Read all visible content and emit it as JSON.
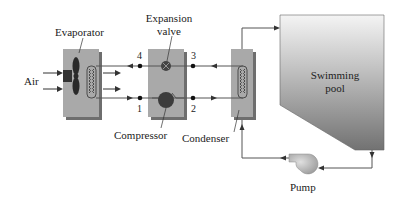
{
  "diagram": {
    "type": "heat pump pool heating system schematic",
    "components": {
      "evaporator": {
        "label": "Evaporator"
      },
      "expansion_valve": {
        "label_line1": "Expansion",
        "label_line2": "valve"
      },
      "compressor": {
        "label": "Compressor"
      },
      "condenser": {
        "label": "Condenser"
      },
      "pool": {
        "label_line1": "Swimming",
        "label_line2": "pool"
      },
      "pump": {
        "label": "Pump"
      },
      "air": {
        "label": "Air"
      }
    },
    "state_points": [
      "1",
      "2",
      "3",
      "4"
    ],
    "colors": {
      "box_fill": "#a9a9a9",
      "box_shadow": "#6e6e6e",
      "pool_top": "#f2f2f2",
      "pool_bottom": "#7a7a7a",
      "line": "#555555",
      "dot": "#111111"
    }
  }
}
